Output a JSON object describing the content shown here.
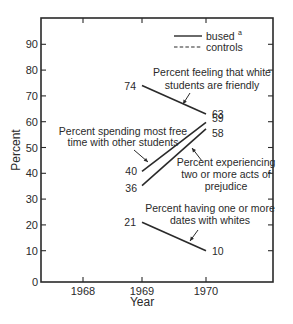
{
  "chart_data": {
    "type": "line",
    "title": "",
    "xlabel": "Year",
    "ylabel": "Percent",
    "x_ticks": [
      "1968",
      "1969",
      "1970"
    ],
    "y_ticks": [
      "0",
      "10",
      "20",
      "30",
      "40",
      "50",
      "60",
      "70",
      "80",
      "90"
    ],
    "ylim": [
      0,
      100
    ],
    "xlim": [
      1967.6,
      1971.1
    ],
    "grid": false,
    "legend": {
      "position": "top-right",
      "entries": [
        {
          "label": "bused",
          "superscript": "a",
          "style": "solid"
        },
        {
          "label": "controls",
          "style": "dashed"
        }
      ]
    },
    "series": [
      {
        "name": "Percent feeling that white students are friendly",
        "label_lines": [
          "Percent feeling that white",
          "students are friendly"
        ],
        "group": "bused",
        "x": [
          1969,
          1970
        ],
        "values": [
          74,
          63
        ],
        "start_label": "74",
        "end_label": "63"
      },
      {
        "name": "Percent spending most free time with other students",
        "label_lines": [
          "Percent spending most free",
          "time  with other students"
        ],
        "group": "bused",
        "x": [
          1969,
          1970
        ],
        "values": [
          40,
          59
        ],
        "start_label": "40",
        "end_label": "59"
      },
      {
        "name": "Percent experiencing two or more acts of prejudice",
        "label_lines": [
          "Percent experiencing",
          "two or more acts of",
          "prejudice"
        ],
        "group": "bused",
        "x": [
          1969,
          1970
        ],
        "values": [
          36,
          58
        ],
        "start_label": "36",
        "end_label": "58"
      },
      {
        "name": "Percent having one or more dates with whites",
        "label_lines": [
          "Percent having one or more",
          "dates with whites"
        ],
        "group": "bused",
        "x": [
          1969,
          1970
        ],
        "values": [
          21,
          10
        ],
        "start_label": "21",
        "end_label": "10"
      }
    ]
  }
}
